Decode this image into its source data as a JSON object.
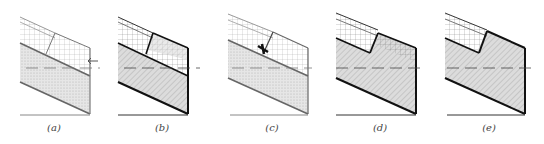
{
  "figure": {
    "panels": [
      {
        "id": "a",
        "label": "(a)",
        "x": 0,
        "variant": "a"
      },
      {
        "id": "b",
        "label": "(b)",
        "x": 108,
        "variant": "b"
      },
      {
        "id": "c",
        "label": "(c)",
        "x": 218,
        "variant": "c"
      },
      {
        "id": "d",
        "label": "(d)",
        "x": 326,
        "variant": "d"
      },
      {
        "id": "e",
        "label": "(e)",
        "x": 435,
        "variant": "e"
      }
    ]
  },
  "colors": {
    "line_light": "#8a8a8a",
    "line_dark": "#222222",
    "fill_stipple": "#d9d9d9",
    "fill_hatch": "#cfcfcf",
    "grid": "#9a9a9a",
    "dash": "#555555"
  }
}
